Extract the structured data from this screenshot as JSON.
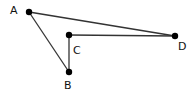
{
  "diagram": {
    "points": {
      "A": {
        "label": "A",
        "x": 29,
        "y": 12
      },
      "B": {
        "label": "B",
        "x": 69,
        "y": 72
      },
      "C": {
        "label": "C",
        "x": 69,
        "y": 35
      },
      "D": {
        "label": "D",
        "x": 175,
        "y": 36
      }
    },
    "segments": [
      [
        "A",
        "D"
      ],
      [
        "A",
        "B"
      ],
      [
        "B",
        "C"
      ],
      [
        "C",
        "D"
      ]
    ],
    "colors": {
      "line": "#333333",
      "point": "#000000"
    }
  }
}
